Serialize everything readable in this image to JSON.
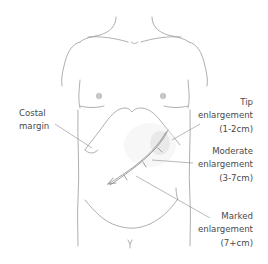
{
  "diagram": {
    "colors": {
      "outline": "#9a9a9a",
      "leader_line": "#8a8a8a",
      "nipple": "#c8c8c8",
      "spleen_shade": "#d0d0d0",
      "text": "#4a4a4a",
      "background": "#ffffff"
    },
    "labels": {
      "costal_margin": {
        "line1": "Costal",
        "line2": "margin"
      },
      "tip": {
        "line1": "Tip",
        "line2": "enlargement",
        "line3": "(1-2cm)"
      },
      "moderate": {
        "line1": "Moderate",
        "line2": "enlargement",
        "line3": "(3-7cm)"
      },
      "marked": {
        "line1": "Marked",
        "line2": "enlargement",
        "line3": "(7+cm)"
      }
    }
  }
}
